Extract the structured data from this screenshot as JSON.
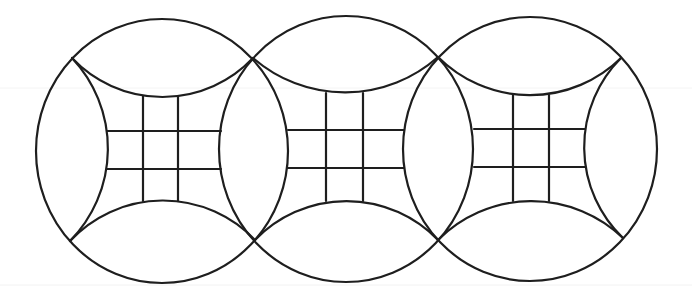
{
  "diagram": {
    "title": "",
    "width": 692,
    "height": 302,
    "background": "#ffffff",
    "stroke_color": "#1e1e1e",
    "stroke_width": 2.2,
    "faint_lines": [
      {
        "y": 88,
        "color": "#f4f4f4"
      },
      {
        "y": 285,
        "color": "#f2f2f2"
      }
    ],
    "circles": [
      {
        "name": "circle-1",
        "cx": 162,
        "cy": 151,
        "rx": 126,
        "ry": 132
      },
      {
        "name": "circle-2",
        "cx": 346,
        "cy": 149,
        "rx": 127,
        "ry": 133
      },
      {
        "name": "circle-3",
        "cx": 530,
        "cy": 149,
        "rx": 127,
        "ry": 132
      }
    ],
    "inner_arcs": [
      {
        "name": "circle-1-top-arc",
        "from": [
          72,
          58
        ],
        "to": [
          253,
          58
        ],
        "r": 124.5,
        "sweep": 0
      },
      {
        "name": "circle-1-bottom-arc",
        "from": [
          70,
          241
        ],
        "to": [
          255,
          240
        ],
        "r": 127,
        "sweep": 1
      },
      {
        "name": "circle-1-left-arc",
        "from": [
          72,
          58
        ],
        "to": [
          70,
          241
        ],
        "r": 132,
        "sweep": 1
      },
      {
        "name": "circle-2-top-arc",
        "from": [
          253,
          58
        ],
        "to": [
          438,
          57
        ],
        "r": 140,
        "sweep": 0
      },
      {
        "name": "circle-2-bottom-arc",
        "from": [
          255,
          240
        ],
        "to": [
          438,
          240
        ],
        "r": 127,
        "sweep": 1
      },
      {
        "name": "circle-3-top-arc",
        "from": [
          438,
          57
        ],
        "to": [
          621,
          58
        ],
        "r": 130,
        "sweep": 0
      },
      {
        "name": "circle-3-bottom-arc",
        "from": [
          438,
          240
        ],
        "to": [
          623,
          238
        ],
        "r": 132,
        "sweep": 1
      },
      {
        "name": "circle-3-right-arc",
        "from": [
          621,
          58
        ],
        "to": [
          623,
          238
        ],
        "r": 126,
        "sweep": 0
      }
    ],
    "grids": [
      {
        "name": "circle-1-grid",
        "verticals": [
          {
            "x": 143,
            "y1": 96,
            "y2": 201
          },
          {
            "x": 178,
            "y1": 96,
            "y2": 201
          }
        ],
        "horizontals": [
          {
            "y": 131,
            "x1": 107,
            "x2": 221
          },
          {
            "y": 169,
            "x1": 107,
            "x2": 221
          }
        ]
      },
      {
        "name": "circle-2-grid",
        "verticals": [
          {
            "x": 326,
            "y1": 93,
            "y2": 201
          },
          {
            "x": 363,
            "y1": 93,
            "y2": 201
          }
        ],
        "horizontals": [
          {
            "y": 130,
            "x1": 288,
            "x2": 404
          },
          {
            "y": 168,
            "x1": 288,
            "x2": 404
          }
        ]
      },
      {
        "name": "circle-3-grid",
        "verticals": [
          {
            "x": 513,
            "y1": 95,
            "y2": 201
          },
          {
            "x": 549,
            "y1": 95,
            "y2": 201
          }
        ],
        "horizontals": [
          {
            "y": 129,
            "x1": 474,
            "x2": 585
          },
          {
            "y": 167,
            "x1": 474,
            "x2": 585
          }
        ]
      }
    ],
    "intersection_points": [
      {
        "name": "circle-1-2-top",
        "x": 253,
        "y": 58
      },
      {
        "name": "circle-1-2-bottom",
        "x": 255,
        "y": 240
      },
      {
        "name": "circle-2-3-top",
        "x": 438,
        "y": 57
      },
      {
        "name": "circle-2-3-bottom",
        "x": 438,
        "y": 240
      }
    ]
  }
}
